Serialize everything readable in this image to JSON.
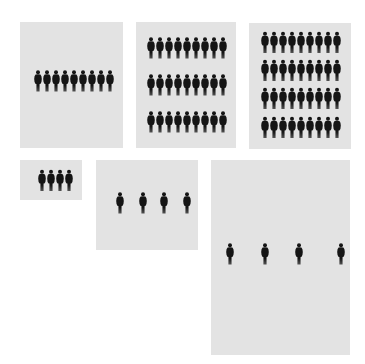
{
  "diagram": {
    "type": "pictogram-panels",
    "background_color": "#ffffff",
    "panel_color": "#e3e3e3",
    "figure_color": "#151515",
    "figure_icon": "person-silhouette-icon",
    "panels": [
      {
        "id": "panel-1",
        "x": 20,
        "y": 22,
        "w": 103,
        "h": 126,
        "fig_h": 22,
        "rows": [
          {
            "y": 70,
            "xs": [
              34,
              43,
              52,
              61,
              70,
              79,
              88,
              97,
              106
            ]
          }
        ]
      },
      {
        "id": "panel-2",
        "x": 136,
        "y": 22,
        "w": 100,
        "h": 126,
        "fig_h": 22,
        "rows": [
          {
            "y": 37,
            "xs": [
              147,
              156,
              165,
              174,
              183,
              192,
              201,
              210,
              219
            ]
          },
          {
            "y": 74,
            "xs": [
              147,
              156,
              165,
              174,
              183,
              192,
              201,
              210,
              219
            ]
          },
          {
            "y": 111,
            "xs": [
              147,
              156,
              165,
              174,
              183,
              192,
              201,
              210,
              219
            ]
          }
        ]
      },
      {
        "id": "panel-3",
        "x": 249,
        "y": 23,
        "w": 102,
        "h": 126,
        "fig_h": 23,
        "rows": [
          {
            "y": 31,
            "xs": [
              261,
              270,
              279,
              288,
              297,
              306,
              315,
              324,
              333
            ]
          },
          {
            "y": 59,
            "xs": [
              261,
              270,
              279,
              288,
              297,
              306,
              315,
              324,
              333
            ]
          },
          {
            "y": 87,
            "xs": [
              261,
              270,
              279,
              288,
              297,
              306,
              315,
              324,
              333
            ]
          },
          {
            "y": 116,
            "xs": [
              261,
              270,
              279,
              288,
              297,
              306,
              315,
              324,
              333
            ]
          }
        ]
      },
      {
        "id": "panel-4",
        "x": 20,
        "y": 160,
        "w": 62,
        "h": 40,
        "fig_h": 23,
        "rows": [
          {
            "y": 169,
            "xs": [
              38,
              47,
              56,
              65
            ]
          }
        ]
      },
      {
        "id": "panel-5",
        "x": 96,
        "y": 160,
        "w": 102,
        "h": 90,
        "fig_h": 22,
        "rows": [
          {
            "y": 192,
            "xs": [
              116,
              139,
              160,
              183
            ]
          }
        ]
      },
      {
        "id": "panel-6",
        "x": 211,
        "y": 160,
        "w": 139,
        "h": 195,
        "fig_h": 22,
        "rows": [
          {
            "y": 243,
            "xs": [
              226,
              261,
              295,
              337
            ]
          }
        ]
      }
    ],
    "counts": {
      "panel-1": 9,
      "panel-2": 27,
      "panel-3": 36,
      "panel-4": 4,
      "panel-5": 4,
      "panel-6": 4
    }
  }
}
